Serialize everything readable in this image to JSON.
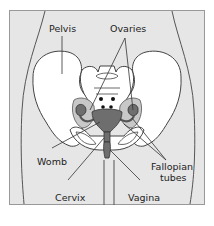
{
  "diagram": {
    "type": "anatomical-illustration",
    "colors": {
      "background": "#e6e6e6",
      "frame": "#888888",
      "bone": "#ffffff",
      "outline": "#444444",
      "organ_light": "#c8c8c8",
      "organ_dark": "#6e6e6e"
    },
    "labels": {
      "pelvis": "Pelvis",
      "ovaries": "Ovaries",
      "womb": "Womb",
      "fallopian_line1": "Fallopian",
      "fallopian_line2": "tubes",
      "cervix": "Cervix",
      "vagina": "Vagina"
    }
  }
}
